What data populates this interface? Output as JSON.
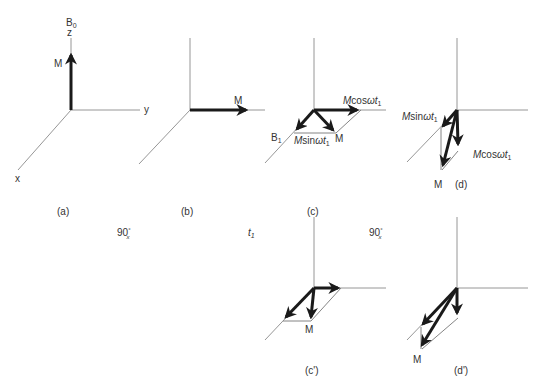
{
  "figure": {
    "colors": {
      "axis": "#8a8a8a",
      "vector": "#1a1a1a",
      "text": "#333333",
      "background": "#ffffff"
    }
  },
  "panels": {
    "a": {
      "caption": "(a)",
      "b0_label": "B",
      "b0_sub": "0",
      "z_label": "z",
      "y_label": "y",
      "x_label": "x",
      "m_label": "M"
    },
    "b": {
      "caption": "(b)",
      "m_label": "M"
    },
    "c": {
      "caption": "(c)",
      "b1_label": "B",
      "b1_sub": "1",
      "m_label": "M",
      "cos_label_pre": "M",
      "cos_label_mid": "cos",
      "cos_label_post": "ωt",
      "cos_sub": "1",
      "sin_label_pre": "M",
      "sin_label_mid": "sin",
      "sin_label_post": "ωt",
      "sin_sub": "1"
    },
    "d": {
      "caption": "(d)",
      "m_label": "M",
      "cos_label_pre": "M",
      "cos_label_mid": "cos",
      "cos_label_post": "ωt",
      "cos_sub": "1",
      "sin_label_pre": "M",
      "sin_label_mid": "sin",
      "sin_label_post": "ωt",
      "sin_sub": "1"
    },
    "c_prime": {
      "caption": "(c')",
      "m_label": "M"
    },
    "d_prime": {
      "caption": "(d')",
      "m_label": "M"
    }
  },
  "transitions": [
    {
      "label": "90",
      "sup": "°",
      "sub": "x"
    },
    {
      "label": "t",
      "sub": "1"
    },
    {
      "label": "90",
      "sup": "°",
      "sub": "x"
    }
  ]
}
